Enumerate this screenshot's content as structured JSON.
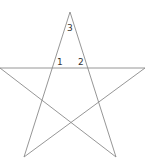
{
  "diagram": {
    "type": "pentagram",
    "stroke_color": "#8a8a8a",
    "vertices": {
      "top": [
        70,
        12
      ],
      "left": [
        0,
        68
      ],
      "right": [
        145,
        68
      ],
      "bottom_left": [
        24,
        157
      ],
      "bottom_right": [
        116,
        157
      ]
    },
    "angle_labels": [
      {
        "text": "1",
        "x": 57,
        "y": 65
      },
      {
        "text": "2",
        "x": 78,
        "y": 65
      },
      {
        "text": "3",
        "x": 67,
        "y": 31
      }
    ]
  }
}
